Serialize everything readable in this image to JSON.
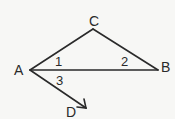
{
  "diagram": {
    "points": {
      "A": {
        "label": "A",
        "x": 30,
        "y": 70
      },
      "B": {
        "label": "B",
        "x": 158,
        "y": 70
      },
      "C": {
        "label": "C",
        "x": 93,
        "y": 29
      },
      "D": {
        "label": "D",
        "x": 86,
        "y": 108
      }
    },
    "segments": [
      [
        "A",
        "C"
      ],
      [
        "C",
        "B"
      ],
      [
        "A",
        "B"
      ]
    ],
    "rays": [
      [
        "A",
        "D"
      ]
    ],
    "angle_labels": [
      {
        "label": "1",
        "at": "A",
        "between": [
          "AC",
          "AB"
        ]
      },
      {
        "label": "2",
        "at": "B",
        "between": [
          "BC",
          "BA"
        ]
      },
      {
        "label": "3",
        "at": "A",
        "between": [
          "AB",
          "AD"
        ]
      }
    ],
    "stroke_color": "#2a2a2a"
  }
}
